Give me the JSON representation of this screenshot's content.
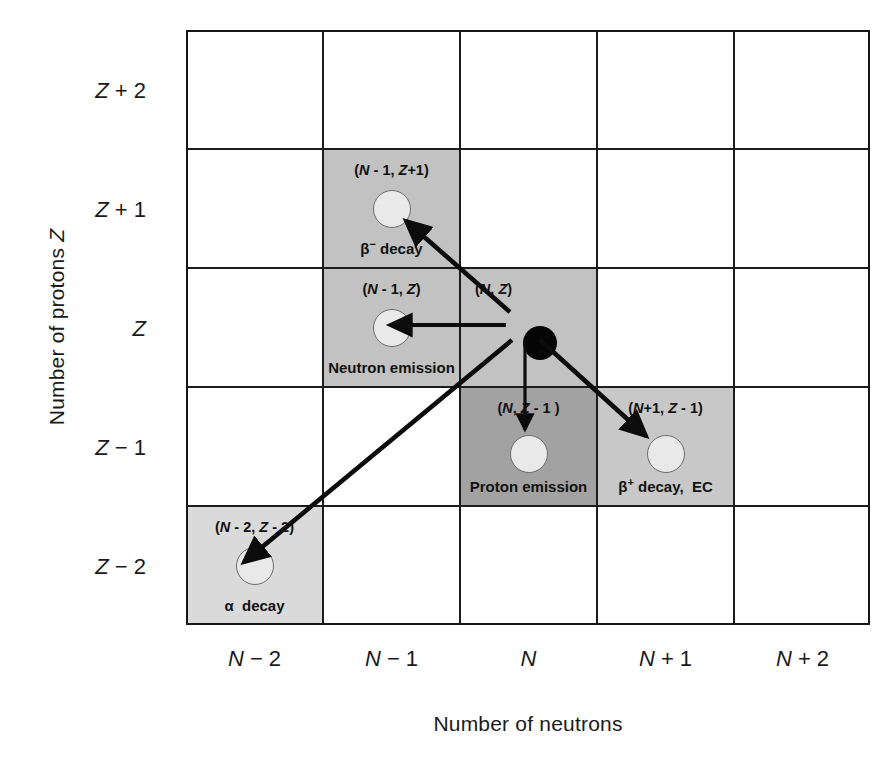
{
  "figure": {
    "type": "nuclide-chart-decay-diagram",
    "x_axis": {
      "title": "Number of neutrons",
      "ticks": [
        "N − 2",
        "N − 1",
        "N",
        "N + 1",
        "N + 2"
      ]
    },
    "y_axis": {
      "title": "Number of protons Z",
      "ticks": [
        "Z + 2",
        "Z + 1",
        "Z",
        "Z − 1",
        "Z − 2"
      ]
    }
  },
  "cells": {
    "parent": {
      "coord": "(N, Z)",
      "mode": "",
      "fill": "#c2c2c2",
      "nucleus": "filled"
    },
    "beta_minus": {
      "coord": "(N - 1, Z+1)",
      "mode": "β− decay",
      "mode_base": "β",
      "mode_sup": "−",
      "mode_rest": " decay",
      "fill": "#c2c2c2",
      "nucleus": "open"
    },
    "neutron_emission": {
      "coord": "(N - 1, Z)",
      "mode": "Neutron emission",
      "fill": "#c2c2c2",
      "nucleus": "open"
    },
    "proton_emission": {
      "coord": "(N, Z - 1 )",
      "mode": "Proton emission",
      "fill": "#a2a2a2",
      "nucleus": "open"
    },
    "beta_plus": {
      "coord": "(N+1, Z - 1)",
      "mode": "β+ decay, EC",
      "mode_base": "β",
      "mode_sup": "+",
      "mode_rest": " decay,  EC",
      "fill": "#c8c8c8",
      "nucleus": "open"
    },
    "alpha": {
      "coord": "(N - 2, Z - 2)",
      "mode": "α  decay",
      "mode_base": "α",
      "mode_sup": "",
      "mode_rest": "  decay",
      "fill": "#dadada",
      "nucleus": "open"
    }
  },
  "colors": {
    "grid_line": "#1c1c1c",
    "frame": "#161616",
    "arrow": "#0c0c0c",
    "text": "#1a1a1a",
    "nucleus_open_fill": "#e9e9e9",
    "nucleus_open_stroke": "#6d6d6d",
    "nucleus_filled": "#050505",
    "page_background": "#ffffff"
  },
  "arrows": [
    {
      "name": "arrow-beta-minus",
      "from": "parent",
      "to": "beta_minus"
    },
    {
      "name": "arrow-neutron-emission",
      "from": "parent",
      "to": "neutron_emission"
    },
    {
      "name": "arrow-proton-emission",
      "from": "parent",
      "to": "proton_emission"
    },
    {
      "name": "arrow-beta-plus",
      "from": "parent",
      "to": "beta_plus"
    },
    {
      "name": "arrow-alpha",
      "from": "parent",
      "to": "alpha"
    }
  ]
}
